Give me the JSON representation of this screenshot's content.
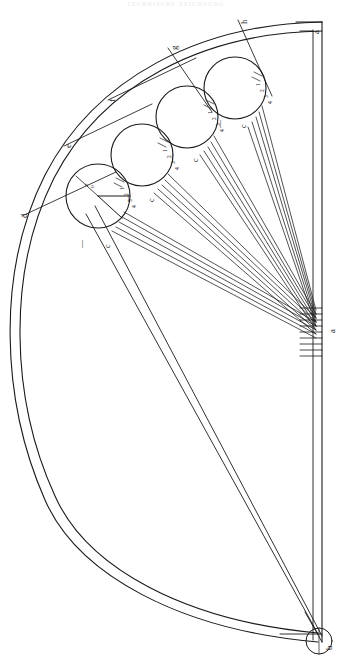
{
  "header": {
    "title": "TECHNISCHE ZEICHNUNG"
  },
  "figure": {
    "kind": "geometric-construction-diagram",
    "orientation_degrees": -90,
    "stroke_color": "#1a1a1a",
    "background_color": "#ffffff"
  },
  "labels": {
    "corner_top_right": "a",
    "apex": "a",
    "bottom_circle": "b",
    "rays": [
      {
        "id": "d",
        "text": "d"
      },
      {
        "id": "e",
        "text": "e"
      },
      {
        "id": "f",
        "text": "f"
      },
      {
        "id": "g",
        "text": "g"
      },
      {
        "id": "h",
        "text": "h"
      }
    ]
  },
  "circles": [
    {
      "id": "circle-1",
      "notch": true,
      "ticks": [
        "1",
        "2",
        "3",
        "4"
      ],
      "marks": [
        "o",
        "e"
      ],
      "below_left": "—",
      "below_right": "c"
    },
    {
      "id": "circle-2",
      "notch": false,
      "ticks": [
        "1",
        "2",
        "3",
        "4"
      ],
      "marks": [],
      "below_left": "—",
      "below_right": "c"
    },
    {
      "id": "circle-3",
      "notch": false,
      "ticks": [
        "1",
        "2",
        "3",
        "4"
      ],
      "marks": [],
      "below_left": "—",
      "below_right": "c"
    },
    {
      "id": "circle-4",
      "notch": false,
      "ticks": [
        "1",
        "2",
        "3",
        "4"
      ],
      "marks": [],
      "below_left": "—",
      "below_right": "c"
    }
  ],
  "annotations": {
    "dash_marks": [
      "—",
      "—",
      "—",
      "—"
    ],
    "c_marks": [
      "c",
      "c",
      "c",
      "c"
    ]
  }
}
